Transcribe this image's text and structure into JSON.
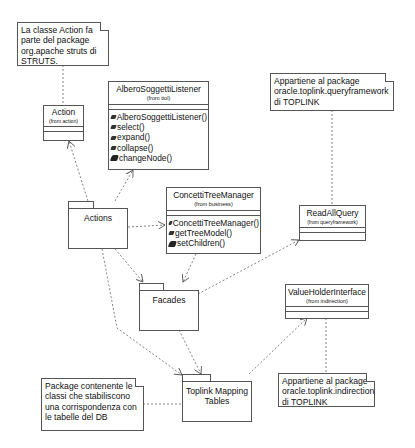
{
  "diagram": {
    "notes": [
      {
        "id": "note-action",
        "lines": [
          "La classe Action fa",
          "parte del package",
          "org.apache struts di",
          "STRUTS."
        ]
      },
      {
        "id": "note-queryframework",
        "lines": [
          "Appartiene al package",
          "oracle.toplink.queryframework",
          "di TOPLINK"
        ]
      },
      {
        "id": "note-mapping",
        "lines": [
          "Package contenente le",
          "classi che stabiliscono",
          "una corrispondenza con",
          "le tabelle del DB"
        ]
      },
      {
        "id": "note-indirection",
        "lines": [
          "Appartiene al package",
          "oracle.toplink.indirection",
          "di TOPLINK"
        ]
      }
    ],
    "classes": {
      "action": {
        "name": "Action",
        "from": "(from action)",
        "operations": []
      },
      "albero": {
        "name": "AlberoSoggettiListener",
        "from": "(from tiol)",
        "operations": [
          {
            "label": "AlberoSoggettiListener()",
            "visibility": "public"
          },
          {
            "label": "select()",
            "visibility": "public"
          },
          {
            "label": "expand()",
            "visibility": "public"
          },
          {
            "label": "collapse()",
            "visibility": "public"
          },
          {
            "label": "changeNode()",
            "visibility": "protected"
          }
        ]
      },
      "concetti": {
        "name": "ConcettiTreeManager",
        "from": "(from business)",
        "operations": [
          {
            "label": "ConcettiTreeManager()",
            "visibility": "public"
          },
          {
            "label": "getTreeModel()",
            "visibility": "public"
          },
          {
            "label": "setChildren()",
            "visibility": "protected"
          }
        ]
      },
      "readallquery": {
        "name": "ReadAllQuery",
        "from": "(from queryframework)",
        "operations": []
      },
      "valueholder": {
        "name": "ValueHolderInterface",
        "from": "(from indirection)",
        "operations": []
      }
    },
    "packages": {
      "actions": {
        "name": "Actions"
      },
      "facades": {
        "name": "Facades"
      },
      "toplink": {
        "name_line1": "Toplink Mapping",
        "name_line2": "Tables"
      }
    },
    "relations": [
      {
        "from": "Actions",
        "to": "Action",
        "type": "dependency"
      },
      {
        "from": "Actions",
        "to": "AlberoSoggettiListener",
        "type": "dependency"
      },
      {
        "from": "Actions",
        "to": "ConcettiTreeManager",
        "type": "dependency"
      },
      {
        "from": "Actions",
        "to": "Facades",
        "type": "dependency"
      },
      {
        "from": "Actions",
        "to": "Toplink Mapping Tables",
        "type": "dependency"
      },
      {
        "from": "ConcettiTreeManager",
        "to": "Facades",
        "type": "dependency"
      },
      {
        "from": "Facades",
        "to": "ReadAllQuery",
        "type": "dependency"
      },
      {
        "from": "Facades",
        "to": "Toplink Mapping Tables",
        "type": "dependency"
      },
      {
        "from": "Toplink Mapping Tables",
        "to": "ValueHolderInterface",
        "type": "dependency"
      },
      {
        "from": "note-action",
        "to": "Action",
        "type": "anchor"
      },
      {
        "from": "note-queryframework",
        "to": "ReadAllQuery",
        "type": "anchor"
      },
      {
        "from": "note-indirection",
        "to": "ValueHolderInterface",
        "type": "anchor"
      },
      {
        "from": "note-mapping",
        "to": "Toplink Mapping Tables",
        "type": "anchor"
      }
    ],
    "colors": {
      "line": "#555555",
      "background": "#ffffff",
      "text": "#111111"
    }
  }
}
